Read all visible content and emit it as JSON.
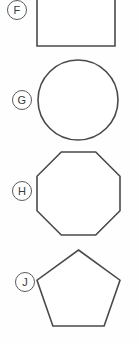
{
  "page": {
    "background_color": "#fefefe",
    "stroke_color": "#4a4a4a",
    "label_text_color": "#3a3a3a",
    "label_border_color": "#5a5a5a",
    "width": 139,
    "height": 346
  },
  "items": [
    {
      "label": "F",
      "shape": "square",
      "shape_icon": "square-shape-icon",
      "label_x": 7,
      "label_y": 0,
      "figure": {
        "x": 37,
        "y": -18,
        "width": 78,
        "height": 64,
        "points": "0,0 78,0 78,64 0,64"
      }
    },
    {
      "label": "G",
      "shape": "circle",
      "shape_icon": "circle-shape-icon",
      "label_x": 12,
      "label_y": 90,
      "figure": {
        "x": 37,
        "y": 59,
        "width": 82,
        "height": 82,
        "cx": 41,
        "cy": 41,
        "r": 40
      }
    },
    {
      "label": "H",
      "shape": "octagon",
      "shape_icon": "octagon-shape-icon",
      "label_x": 12,
      "label_y": 181,
      "figure": {
        "x": 37,
        "y": 152,
        "width": 83,
        "height": 83,
        "points": "24.3,0 58.7,0 83,24.3 83,58.7 58.7,83 24.3,83 0,58.7 0,24.3"
      }
    },
    {
      "label": "J",
      "shape": "pentagon",
      "shape_icon": "pentagon-shape-icon",
      "label_x": 15,
      "label_y": 272,
      "figure": {
        "x": 37,
        "y": 250,
        "width": 83,
        "height": 76,
        "points": "41.5,0 83,30.2 67.1,76 15.9,76 0,30.2"
      }
    }
  ]
}
